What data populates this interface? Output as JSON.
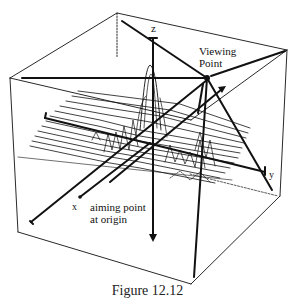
{
  "figure": {
    "caption": "Figure 12.12",
    "labels": {
      "z_axis": "z",
      "x_axis": "x",
      "y_axis": "y",
      "viewing_point_line1": "Viewing",
      "viewing_point_line2": "Point",
      "aiming_line1": "aiming point",
      "aiming_line2": "at origin"
    },
    "colors": {
      "ink": "#111111",
      "background": "#ffffff"
    }
  }
}
